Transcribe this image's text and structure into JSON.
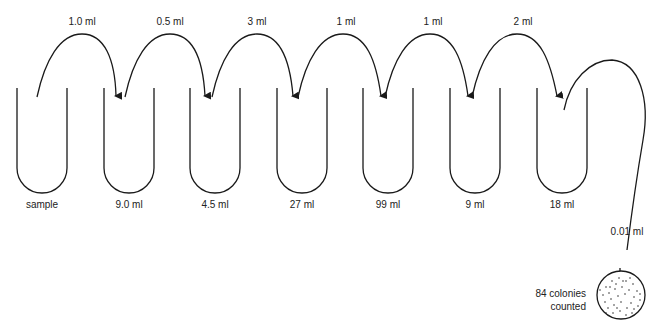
{
  "diagram": {
    "type": "serial-dilution",
    "transfers": [
      {
        "label": "1.0 ml",
        "from": 0,
        "to": 1
      },
      {
        "label": "0.5 ml",
        "from": 1,
        "to": 2
      },
      {
        "label": "3 ml",
        "from": 2,
        "to": 3
      },
      {
        "label": "1 ml",
        "from": 3,
        "to": 4
      },
      {
        "label": "1 ml",
        "from": 4,
        "to": 5
      },
      {
        "label": "2 ml",
        "from": 5,
        "to": 6
      }
    ],
    "tubes": [
      {
        "label": "sample"
      },
      {
        "label": "9.0 ml"
      },
      {
        "label": "4.5 ml"
      },
      {
        "label": "27 ml"
      },
      {
        "label": "99 ml"
      },
      {
        "label": "9 ml"
      },
      {
        "label": "18 ml"
      }
    ],
    "plating": {
      "volume_label": "0.01 ml",
      "result_line1": "84 colonies",
      "result_line2": "counted"
    },
    "colors": {
      "stroke": "#1a1a1a",
      "background": "#ffffff"
    }
  }
}
